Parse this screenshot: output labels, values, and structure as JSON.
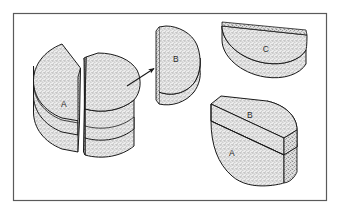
{
  "figure": {
    "background_color": "#ffffff",
    "border_color": "#5a5a5a",
    "outline_color": "#1a1a1a",
    "fill_color": "#e6e6e6",
    "stipple_color": "#8a8a8a",
    "label_color": "#2b2b2b"
  },
  "frame": {
    "name": "figure-border",
    "x": 13,
    "y": 13,
    "width": 314,
    "height": 188
  },
  "shapes": [
    {
      "id": "split-cylinder",
      "name": "split-cylinder-assembly",
      "caption": "Whole disk split into two halves",
      "labels": [
        {
          "text": "A",
          "x": 64,
          "y": 107
        }
      ]
    },
    {
      "id": "half-disk-b-upright",
      "name": "half-disk-b-upright",
      "caption": "Detached half-disk standing on edge",
      "labels": [
        {
          "text": "B",
          "x": 176,
          "y": 62
        }
      ]
    },
    {
      "id": "half-disk-c-flat",
      "name": "half-disk-c-flat",
      "caption": "Half-disk lying flat",
      "labels": [
        {
          "text": "C",
          "x": 266,
          "y": 52
        }
      ]
    },
    {
      "id": "stacked-half-cylinder",
      "name": "stacked-half-cylinder-ab",
      "caption": "Half cylinder sliced into two stacked layers",
      "labels": [
        {
          "text": "B",
          "x": 250,
          "y": 118
        },
        {
          "text": "A",
          "x": 232,
          "y": 155
        }
      ]
    }
  ],
  "arrow": {
    "name": "motion-arrow",
    "from_x": 127,
    "from_y": 86,
    "to_x": 156,
    "to_y": 67
  }
}
